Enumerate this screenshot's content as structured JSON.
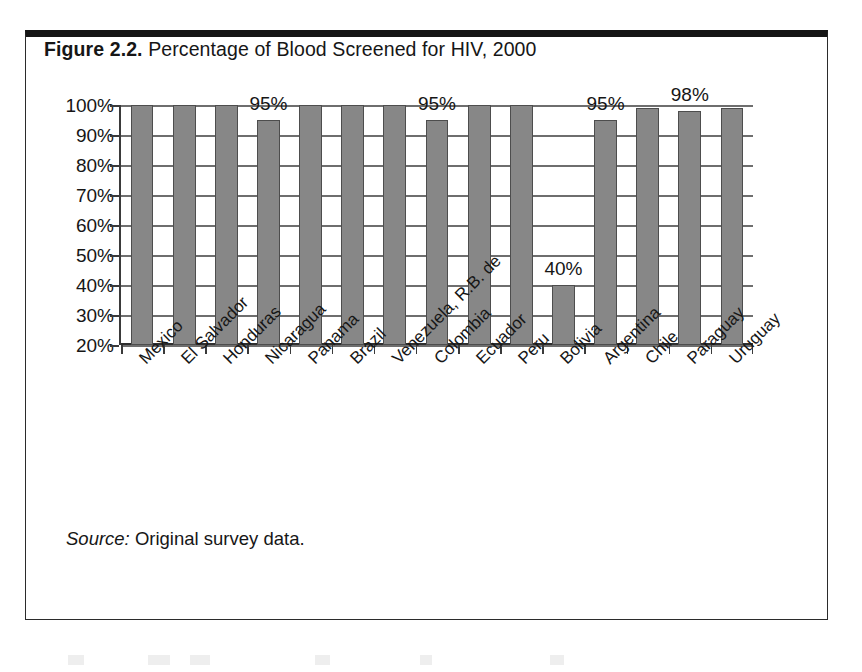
{
  "figure": {
    "label": "Figure 2.2.",
    "title": " Percentage of Blood Screened for HIV, 2000",
    "source_lead": "Source:",
    "source_text": " Original survey data."
  },
  "chart_data": {
    "type": "bar",
    "title": "Figure 2.2. Percentage of Blood Screened for HIV, 2000",
    "xlabel": "",
    "ylabel": "",
    "ylim": [
      20,
      100
    ],
    "grid": true,
    "legend": "none",
    "y_ticks": [
      "20%",
      "30%",
      "40%",
      "50%",
      "60%",
      "70%",
      "80%",
      "90%",
      "100%"
    ],
    "y_tick_values": [
      20,
      30,
      40,
      50,
      60,
      70,
      80,
      90,
      100
    ],
    "categories": [
      "Mexico",
      "El Salvador",
      "Honduras",
      "Nicaragua",
      "Panama",
      "Brazil",
      "Venezuela, R.B. de",
      "Colombia",
      "Ecuador",
      "Peru",
      "Bolivia",
      "Argentina",
      "Chile",
      "Paraguay",
      "Uruguay"
    ],
    "values": [
      100,
      100,
      100,
      95,
      100,
      100,
      100,
      95,
      100,
      100,
      40,
      95,
      99,
      98,
      99
    ],
    "data_labels": [
      "",
      "",
      "",
      "95%",
      "",
      "",
      "",
      "95%",
      "",
      "",
      "40%",
      "95%",
      "",
      "98%",
      ""
    ],
    "source": "Source: Original survey data."
  },
  "colors": {
    "bar_fill": "#878787",
    "bar_stroke": "#4d4d4d",
    "axis": "#3a3a3a",
    "gridline": "#6e6e6e",
    "text": "#161616",
    "frame": "#2b2b2b",
    "frame_top": "#151515"
  }
}
